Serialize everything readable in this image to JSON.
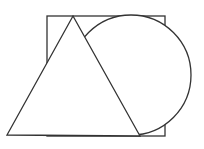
{
  "diagram": {
    "stroke_color": "#333333",
    "background": "#ffffff",
    "shapes": [
      {
        "type": "square",
        "x": 47,
        "y": 16,
        "width": 118,
        "height": 120
      },
      {
        "type": "circle",
        "cx": 131,
        "cy": 75,
        "r": 60
      },
      {
        "type": "triangle",
        "points": [
          [
            73,
            16
          ],
          [
            140,
            136
          ],
          [
            7,
            135
          ]
        ]
      }
    ]
  }
}
